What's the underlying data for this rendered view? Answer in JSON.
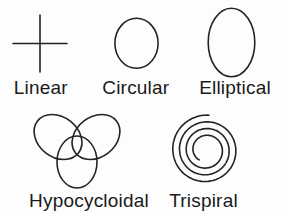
{
  "figure": {
    "background_color": "#fdfdfd",
    "stroke_color": "#232323",
    "text_color": "#1a1a1a"
  },
  "patterns": [
    {
      "name": "Linear",
      "shape": "crosshair"
    },
    {
      "name": "Circular",
      "shape": "circle"
    },
    {
      "name": "Elliptical",
      "shape": "vertical-ellipse"
    },
    {
      "name": "Hypocycloidal",
      "shape": "trefoil-of-three-ellipses"
    },
    {
      "name": "Trispiral",
      "shape": "spiral"
    }
  ],
  "trispiral_geometry": {
    "cx": 206,
    "cy": 150,
    "inner_radius": 12,
    "outer_radius": 35,
    "start_angle_deg": 125,
    "sweep_deg": 1232
  }
}
